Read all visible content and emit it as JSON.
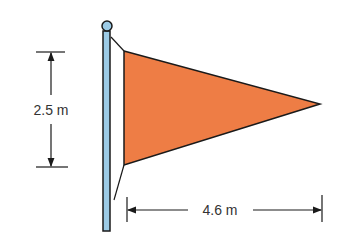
{
  "diagram": {
    "height_label": "2.5 m",
    "length_label": "4.6 m",
    "colors": {
      "flag": "#EE7D45",
      "pole": "#9CCBE6",
      "outline": "#1a1a1a",
      "text": "#333333"
    }
  }
}
